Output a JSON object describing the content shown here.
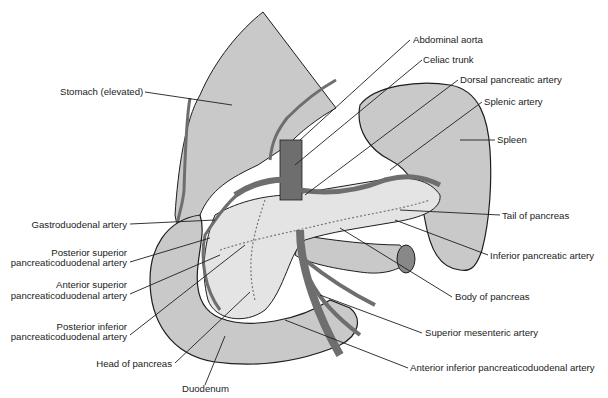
{
  "diagram": {
    "colors": {
      "background": "#ffffff",
      "organ_fill": "#c9c9c9",
      "pancreas_fill": "#e4e4e4",
      "artery_fill": "#6e6e6e",
      "outline": "#1e1e1e",
      "leader_line": "#1e1e1e",
      "label_text": "#222222"
    },
    "labels": {
      "stomach": "Stomach (elevated)",
      "abdominal_aorta": "Abdominal aorta",
      "celiac_trunk": "Celiac trunk",
      "dorsal_pancreatic_artery": "Dorsal pancreatic artery",
      "splenic_artery": "Splenic artery",
      "spleen": "Spleen",
      "gastroduodenal_artery": "Gastroduodenal artery",
      "post_sup_pd_1": "Posterior superior",
      "post_sup_pd_2": "pancreaticoduodenal artery",
      "ant_sup_pd_1": "Anterior superior",
      "ant_sup_pd_2": "pancreaticoduodenal artery",
      "post_inf_pd_1": "Posterior inferior",
      "post_inf_pd_2": "pancreaticoduodenal artery",
      "head_of_pancreas": "Head of pancreas",
      "duodenum": "Duodenum",
      "tail_of_pancreas": "Tail of pancreas",
      "inferior_pancreatic_artery": "Inferior pancreatic artery",
      "body_of_pancreas": "Body of pancreas",
      "superior_mesenteric_artery": "Superior mesenteric artery",
      "ant_inf_pd": "Anterior inferior pancreaticoduodenal artery"
    }
  }
}
